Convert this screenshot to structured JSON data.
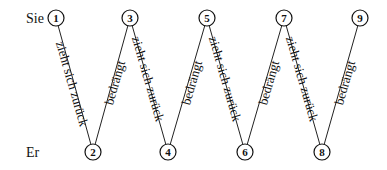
{
  "labels": {
    "top": "Sie",
    "bottom": "Er"
  },
  "nodes": [
    {
      "id": "1",
      "row": "top"
    },
    {
      "id": "2",
      "row": "bottom"
    },
    {
      "id": "3",
      "row": "top"
    },
    {
      "id": "4",
      "row": "bottom"
    },
    {
      "id": "5",
      "row": "top"
    },
    {
      "id": "6",
      "row": "bottom"
    },
    {
      "id": "7",
      "row": "top"
    },
    {
      "id": "8",
      "row": "bottom"
    },
    {
      "id": "9",
      "row": "top"
    }
  ],
  "edges": [
    {
      "from": "1",
      "to": "2",
      "label": "zieht sich zurück"
    },
    {
      "from": "2",
      "to": "3",
      "label": "bedrängt"
    },
    {
      "from": "3",
      "to": "4",
      "label": "zieht sich zurück"
    },
    {
      "from": "4",
      "to": "5",
      "label": "bedrängt"
    },
    {
      "from": "5",
      "to": "6",
      "label": "zieht sich zurück"
    },
    {
      "from": "6",
      "to": "7",
      "label": "bedrängt"
    },
    {
      "from": "7",
      "to": "8",
      "label": "zieht sich zurück"
    },
    {
      "from": "8",
      "to": "9",
      "label": "bedrängt"
    }
  ]
}
